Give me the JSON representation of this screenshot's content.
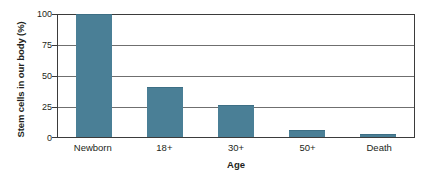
{
  "chart_data": {
    "type": "bar",
    "title": "",
    "subtitle": "",
    "xlabel": "Age",
    "ylabel": "Stem cells in our body (%)",
    "categories": [
      "Newborn",
      "18+",
      "30+",
      "50+",
      "Death"
    ],
    "values": [
      100,
      40,
      25,
      5,
      2
    ],
    "series": [
      {
        "name": "Stem cells in our body (%)",
        "values": [
          100,
          40,
          25,
          5,
          2
        ]
      }
    ],
    "ylim": [
      0,
      100
    ],
    "yticks": [
      0,
      25,
      50,
      75,
      100
    ],
    "ytick_labels": [
      "0",
      "25",
      "50",
      "75",
      "100"
    ],
    "grid": true,
    "grid_axis": "y",
    "legend": false,
    "legend_position": "none",
    "bar_color": "#4a7f96",
    "frame_color": "#3b3b3b",
    "gridline_color": "#6f6f6f",
    "background_color": "#ffffff",
    "annotations": []
  }
}
